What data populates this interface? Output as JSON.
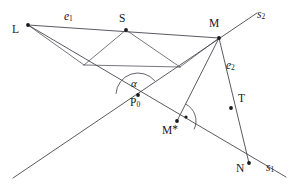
{
  "diagram": {
    "background_color": "#ffffff",
    "stroke_color": "#3c3c46",
    "label_color": "#17171c",
    "width": 292,
    "height": 187
  },
  "points": [
    {
      "id": "L",
      "label": "L",
      "subscript": "",
      "x": 28,
      "y": 25,
      "label_x": 12,
      "label_y": 26,
      "dot": true
    },
    {
      "id": "S",
      "label": "S",
      "subscript": "",
      "x": 126,
      "y": 30,
      "label_x": 120,
      "label_y": 17,
      "dot": true
    },
    {
      "id": "M",
      "label": "M",
      "subscript": "",
      "x": 219,
      "y": 38,
      "label_x": 210,
      "label_y": 21,
      "dot": true
    },
    {
      "id": "P0",
      "label": "P",
      "subscript": "0",
      "x": 138,
      "y": 95,
      "label_x": 131,
      "label_y": 99,
      "dot": true
    },
    {
      "id": "Mstar",
      "label": "M",
      "subscript": "",
      "x": 177,
      "y": 121,
      "label_x": 163,
      "label_y": 126,
      "dot": true
    },
    {
      "id": "T",
      "label": "T",
      "subscript": "",
      "x": 231,
      "y": 108,
      "label_x": 238,
      "label_y": 96,
      "dot": true
    },
    {
      "id": "N",
      "label": "N",
      "subscript": "",
      "x": 249,
      "y": 163,
      "label_x": 238,
      "label_y": 165,
      "dot": true
    }
  ],
  "labels": {
    "L": "L",
    "S": "S",
    "M": "M",
    "P0_base": "P",
    "P0_sub": "0",
    "Mstar_base": "M",
    "Mstar_star": "*",
    "T": "T",
    "N": "N",
    "e1_base": "e",
    "e1_sub": "1",
    "e2_base": "e",
    "e2_sub": "2",
    "s1_base": "s",
    "s1_sub": "1",
    "s2_base": "s",
    "s2_sub": "2",
    "alpha": "α"
  },
  "segment_labels": [
    {
      "id": "e1",
      "base": "e",
      "sub": "1",
      "x": 64,
      "y": 12
    },
    {
      "id": "e2",
      "base": "e",
      "sub": "2",
      "x": 227,
      "y": 62
    },
    {
      "id": "s1",
      "base": "s",
      "sub": "1",
      "x": 266,
      "y": 162
    },
    {
      "id": "s2",
      "base": "s",
      "sub": "2",
      "x": 258,
      "y": 10
    }
  ],
  "angle_label": {
    "id": "alpha",
    "text": "α",
    "x": 131,
    "y": 79
  },
  "lines": [
    {
      "id": "line-s2",
      "name": "ray-s2-through-P0-M",
      "x1": 13,
      "y1": 178,
      "x2": 257,
      "y2": 13
    },
    {
      "id": "line-s1",
      "name": "ray-s1-through-L-P0-N",
      "x1": 28,
      "y1": 25,
      "x2": 286,
      "y2": 177
    },
    {
      "id": "line-e1",
      "name": "segment-e1-L-to-M",
      "x1": 28,
      "y1": 25,
      "x2": 219,
      "y2": 38
    },
    {
      "id": "line-e2",
      "name": "segment-e2-M-to-N",
      "x1": 219,
      "y1": 38,
      "x2": 249,
      "y2": 163
    },
    {
      "id": "line-M-Mstar",
      "name": "segment-M-to-Mstar",
      "x1": 219,
      "y1": 38,
      "x2": 177,
      "y2": 121
    },
    {
      "id": "line-L-V1",
      "name": "segment-L-to-vertex-left",
      "x1": 28,
      "y1": 25,
      "x2": 84,
      "y2": 65
    },
    {
      "id": "line-V1-V2",
      "name": "segment-vertex-left-to-vertex-right",
      "x1": 84,
      "y1": 65,
      "x2": 180,
      "y2": 67
    },
    {
      "id": "line-V2-M",
      "name": "segment-vertex-right-to-M",
      "x1": 180,
      "y1": 67,
      "x2": 219,
      "y2": 38
    },
    {
      "id": "line-S-V1",
      "name": "segment-S-to-vertex-left",
      "x1": 126,
      "y1": 30,
      "x2": 84,
      "y2": 65
    },
    {
      "id": "line-S-V2",
      "name": "segment-S-to-vertex-right",
      "x1": 126,
      "y1": 30,
      "x2": 180,
      "y2": 67
    }
  ],
  "angle_arcs": [
    {
      "id": "arc-alpha",
      "name": "angle-arc-alpha-at-P0",
      "cx": 138,
      "cy": 95,
      "r": 22,
      "start_deg": 183,
      "end_deg": 320
    },
    {
      "id": "arc-right-angle",
      "name": "angle-arc-right-angle-at-Mstar",
      "cx": 177,
      "cy": 121,
      "r": 19,
      "start_deg": 297,
      "end_deg": 26
    }
  ],
  "right_angle_dot": {
    "name": "right-angle-marker-dot",
    "x": 186,
    "y": 117,
    "r": 1.6
  }
}
